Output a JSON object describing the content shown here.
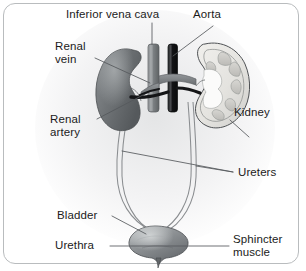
{
  "figure": {
    "background_color": "#ffffff",
    "border_color": "#b9bcbe",
    "label_color": "#1b1b1b",
    "leader_line_color": "#55595c"
  },
  "labels": {
    "inferior_vena_cava": "Inferior vena cava",
    "aorta": "Aorta",
    "renal_vein_line1": "Renal",
    "renal_vein_line2": "vein",
    "renal_artery_line1": "Renal",
    "renal_artery_line2": "artery",
    "kidney": "Kidney",
    "ureters": "Ureters",
    "bladder": "Bladder",
    "urethra": "Urethra",
    "sphincter_muscle_line1": "Sphincter",
    "sphincter_muscle_line2": "muscle"
  },
  "structures": {
    "left_kidney": {
      "name": "left kidney",
      "appearance": "solid whole kidney, dark gray",
      "fill": "#6f7376"
    },
    "right_kidney": {
      "name": "right kidney",
      "appearance": "cross-section showing cortex, medulla pyramids and renal pelvis",
      "fill": "#e8e7e3"
    },
    "inferior_vena_cava": {
      "name": "inferior vena cava",
      "appearance": "vertical vessel, medium gray",
      "fill": "#8d9093"
    },
    "aorta": {
      "name": "aorta",
      "appearance": "vertical vessel, near black",
      "fill": "#1e1f21"
    },
    "renal_vein": {
      "name": "renal vein",
      "appearance": "horizontal branch from vena cava to left kidney",
      "fill": "#7e8285"
    },
    "renal_artery": {
      "name": "renal artery",
      "appearance": "horizontal dark branch from aorta to kidneys",
      "fill": "#1e1f21"
    },
    "ureters": {
      "name": "ureters",
      "appearance": "pair of long thin tubes descending from each kidney to bladder",
      "count": 2,
      "stroke": "#8a8d90"
    },
    "bladder": {
      "name": "urinary bladder",
      "appearance": "rounded sac, gray with highlight",
      "fill": "#8b8f92"
    },
    "urethra": {
      "name": "urethra",
      "appearance": "short outlet at bladder neck",
      "fill": "#6d7174"
    },
    "sphincter_muscle": {
      "name": "sphincter muscle",
      "appearance": "ring at bladder neck where urethra exits"
    }
  }
}
